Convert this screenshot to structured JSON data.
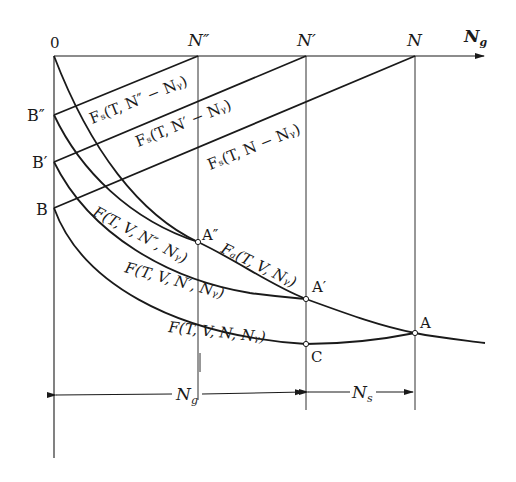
{
  "diagram": {
    "axes": {
      "origin_label": "0",
      "x_axis_label": "N",
      "x_axis_label_sub": "g"
    },
    "x_ticks": [
      {
        "id": "N2",
        "label": "N″",
        "x": 198
      },
      {
        "id": "N1",
        "label": "N′",
        "x": 306
      },
      {
        "id": "N",
        "label": "N",
        "x": 415
      }
    ],
    "y_ticks": [
      {
        "id": "B2",
        "label": "B″",
        "y": 115
      },
      {
        "id": "B1",
        "label": "B′",
        "y": 162
      },
      {
        "id": "B",
        "label": "B",
        "y": 208
      }
    ],
    "lines": [
      {
        "id": "fs-n2",
        "label": "Fₛ(T, N″ − Nᵧ)"
      },
      {
        "id": "fs-n1",
        "label": "Fₛ(T, N′ − Nᵧ)"
      },
      {
        "id": "fs-n",
        "label": "Fₛ(T, N − Nᵧ)"
      }
    ],
    "curves": [
      {
        "id": "f-n2",
        "label": "F(T, V, N″, Nᵧ)"
      },
      {
        "id": "f-n1",
        "label": "F(T, V, N′, Nᵧ)"
      },
      {
        "id": "f-n",
        "label": "F(T, V, N, Nᵧ)"
      },
      {
        "id": "fa",
        "label": "Fₐ(T, V, Nᵧ)"
      }
    ],
    "points": [
      {
        "id": "A2",
        "label": "A″",
        "x": 198,
        "y": 242
      },
      {
        "id": "A1",
        "label": "A′",
        "x": 306,
        "y": 299
      },
      {
        "id": "A",
        "label": "A",
        "x": 415,
        "y": 333
      },
      {
        "id": "C",
        "label": "C",
        "x": 306,
        "y": 344
      }
    ],
    "dimensions": [
      {
        "id": "ng-span",
        "label": "N",
        "sub": "g"
      },
      {
        "id": "ns-span",
        "label": "N",
        "sub": "s"
      }
    ]
  }
}
